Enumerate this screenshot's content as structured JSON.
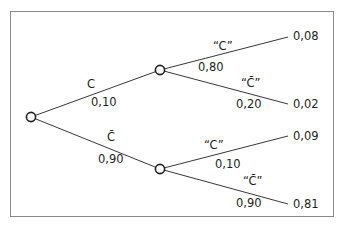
{
  "diagram": {
    "type": "probability-tree",
    "root": {
      "branches": [
        {
          "event": "C",
          "probability": "0,10",
          "children": [
            {
              "event": "“C”",
              "probability": "0,80",
              "joint": "0,08"
            },
            {
              "event": "“C̄”",
              "probability": "0,20",
              "joint": "0,02"
            }
          ]
        },
        {
          "event": "C̄",
          "probability": "0,90",
          "children": [
            {
              "event": "“C”",
              "probability": "0,10",
              "joint": "0,09"
            },
            {
              "event": "“C̄”",
              "probability": "0,90",
              "joint": "0,81"
            }
          ]
        }
      ]
    }
  },
  "labels": {
    "b1_event": "C",
    "b1_prob": "0,10",
    "b2_event": "C̄",
    "b2_prob": "0,90",
    "b11_event": "“C”",
    "b11_prob": "0,80",
    "b11_joint": "0,08",
    "b12_event": "“C̄”",
    "b12_prob": "0,20",
    "b12_joint": "0,02",
    "b21_event": "“C”",
    "b21_prob": "0,10",
    "b21_joint": "0,09",
    "b22_event": "“C̄”",
    "b22_prob": "0,90",
    "b22_joint": "0,81"
  },
  "colors": {
    "line": "#231f20",
    "frame": "#8a8a8a",
    "node_fill": "#ffffff"
  }
}
